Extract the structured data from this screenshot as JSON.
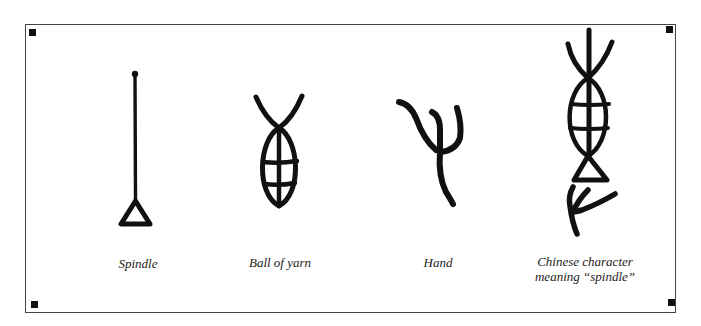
{
  "figure": {
    "colors": {
      "ink": "#111111",
      "frame": "#444444",
      "background": "#ffffff"
    },
    "panels": [
      {
        "id": "spindle",
        "caption": "Spindle",
        "glyph": "spindle-glyph"
      },
      {
        "id": "ball-of-yarn",
        "caption": "Ball of yarn",
        "glyph": "ball-of-yarn-glyph"
      },
      {
        "id": "hand",
        "caption": "Hand",
        "glyph": "hand-glyph"
      },
      {
        "id": "chinese-character",
        "caption_line1": "Chinese character",
        "caption_line2": "meaning “spindle”",
        "glyph": "chinese-spindle-character-glyph"
      }
    ],
    "corner_markers": 4
  }
}
